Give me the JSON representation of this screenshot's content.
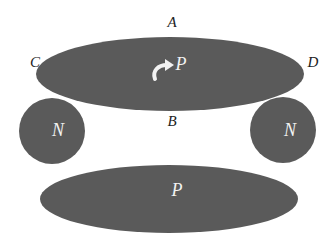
{
  "diagram": {
    "colors": {
      "shape_fill": "#5a5a5a",
      "label_dark": "#222222",
      "label_light": "#f2f2f2",
      "background": "#ffffff"
    },
    "top_region": {
      "label": "P",
      "has_curved_arrow": true
    },
    "left_circle": {
      "label": "N"
    },
    "right_circle": {
      "label": "N"
    },
    "bottom_region": {
      "label": "P"
    },
    "points": {
      "A": "A",
      "B": "B",
      "C": "C",
      "D": "D"
    },
    "icons": {
      "arrow": "curved-arrow-icon"
    }
  }
}
